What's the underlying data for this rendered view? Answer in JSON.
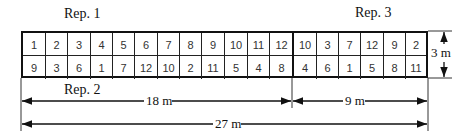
{
  "diagram": {
    "labels": {
      "rep1": "Rep. 1",
      "rep2": "Rep. 2",
      "rep3": "Rep. 3",
      "height": "3 m",
      "width_left": "18 m",
      "width_right": "9 m",
      "width_total": "27 m"
    },
    "left_block": {
      "row1": [
        "1",
        "2",
        "3",
        "4",
        "5",
        "6",
        "7",
        "8",
        "9",
        "10",
        "11",
        "12"
      ],
      "row2": [
        "9",
        "3",
        "6",
        "1",
        "7",
        "12",
        "10",
        "2",
        "11",
        "5",
        "4",
        "8"
      ]
    },
    "right_block": {
      "row1": [
        "10",
        "3",
        "7",
        "12",
        "9",
        "2"
      ],
      "row2": [
        "4",
        "6",
        "1",
        "5",
        "8",
        "11"
      ]
    }
  }
}
